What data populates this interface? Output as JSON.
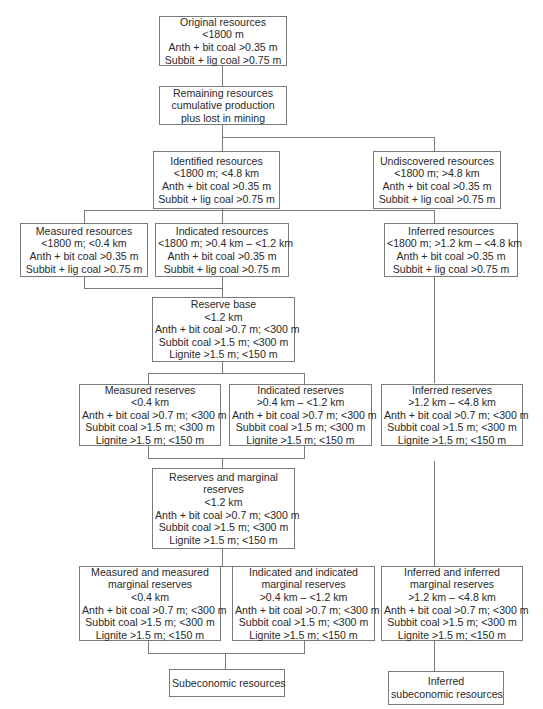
{
  "diagram": {
    "type": "coal resource classification flowchart",
    "nodes": {
      "original": {
        "lines": [
          "Original resources",
          "<1800 m",
          "Anth + bit coal >0.35 m",
          "Subbit + lig coal >0.75 m"
        ]
      },
      "remaining": {
        "lines": [
          "Remaining resources",
          "cumulative production",
          "plus lost in mining"
        ]
      },
      "identified": {
        "lines": [
          "Identified resources",
          "<1800 m; <4.8 km",
          "Anth + bit coal >0.35 m",
          "Subbit + lig coal >0.75 m"
        ]
      },
      "undiscovered": {
        "lines": [
          "Undiscovered resources",
          "<1800 m; >4.8 km",
          "Anth + bit coal >0.35 m",
          "Subbit + lig coal >0.75 m"
        ]
      },
      "measured_resources": {
        "lines": [
          "Measured resources",
          "<1800 m; <0.4 km",
          "Anth + bit coal >0.35 m",
          "Subbit + lig coal >0.75 m"
        ]
      },
      "indicated_resources": {
        "lines": [
          "Indicated resources",
          "<1800 m; >0.4 km – <1.2 km",
          "Anth + bit coal >0.35 m",
          "Subbit + lig coal >0.75 m"
        ]
      },
      "inferred_resources": {
        "lines": [
          "Inferred resources",
          "<1800 m; >1.2 km – <4.8 km",
          "Anth + bit coal >0.35 m",
          "Subbit + lig coal >0.75 m"
        ]
      },
      "reserve_base": {
        "lines": [
          "Reserve base",
          "<1.2 km",
          "Anth + bit coal >0.7 m; <300 m",
          "Subbit coal >1.5 m; <300 m",
          "Lignite >1.5 m; <150 m"
        ]
      },
      "measured_reserves": {
        "lines": [
          "Measured reserves",
          "<0.4 km",
          "Anth + bit coal >0.7 m; <300 m",
          "Subbit coal >1.5 m; <300 m",
          "Lignite >1.5 m; <150 m"
        ]
      },
      "indicated_reserves": {
        "lines": [
          "Indicated reserves",
          ">0.4 km – <1.2 km",
          "Anth + bit coal >0.7 m; <300 m",
          "Subbit coal >1.5 m; <300 m",
          "Lignite >1.5 m; <150 m"
        ]
      },
      "inferred_reserves": {
        "lines": [
          "Inferred reserves",
          ">1.2 km – <4.8 km",
          "Anth + bit coal >0.7 m; <300 m",
          "Subbit coal >1.5 m; <300 m",
          "Lignite >1.5 m; <150 m"
        ]
      },
      "reserves_marginal": {
        "lines": [
          "Reserves and marginal",
          "reserves",
          "<1.2 km",
          "Anth + bit coal >0.7 m; <300 m",
          "Subbit coal >1.5 m; <300 m",
          "Lignite >1.5 m; <150 m"
        ]
      },
      "measured_marginal": {
        "lines": [
          "Measured and measured",
          "marginal reserves",
          "<0.4 km",
          "Anth + bit coal >0.7 m; <300 m",
          "Subbit coal >1.5 m; <300 m",
          "Lignite >1.5 m; <150 m"
        ]
      },
      "indicated_marginal": {
        "lines": [
          "Indicated and indicated",
          "marginal reserves",
          ">0.4 km – <1.2 km",
          "Anth + bit coal >0.7 m; <300 m",
          "Subbit coal >1.5 m; <300 m",
          "Lignite >1.5 m; <150 m"
        ]
      },
      "inferred_marginal": {
        "lines": [
          "Inferred and inferred",
          "marginal reserves",
          ">1.2 km – <4.8 km",
          "Anth + bit coal >0.7 m; <300 m",
          "Subbit coal >1.5 m; <300 m",
          "Lignite >1.5 m; <150 m"
        ]
      },
      "subeconomic": {
        "lines": [
          "Subeconomic resources"
        ]
      },
      "inferred_subeconomic": {
        "lines": [
          "Inferred",
          "subeconomic resources"
        ]
      }
    },
    "edges": [
      [
        "original",
        "remaining"
      ],
      [
        "remaining",
        "identified"
      ],
      [
        "remaining",
        "undiscovered"
      ],
      [
        "identified",
        "measured_resources"
      ],
      [
        "identified",
        "indicated_resources"
      ],
      [
        "identified",
        "inferred_resources"
      ],
      [
        "measured_resources",
        "reserve_base"
      ],
      [
        "indicated_resources",
        "reserve_base"
      ],
      [
        "reserve_base",
        "measured_reserves"
      ],
      [
        "reserve_base",
        "indicated_reserves"
      ],
      [
        "inferred_resources",
        "inferred_reserves"
      ],
      [
        "measured_reserves",
        "reserves_marginal"
      ],
      [
        "indicated_reserves",
        "reserves_marginal"
      ],
      [
        "reserves_marginal",
        "measured_marginal"
      ],
      [
        "reserves_marginal",
        "indicated_marginal"
      ],
      [
        "inferred_reserves",
        "inferred_marginal"
      ],
      [
        "measured_marginal",
        "subeconomic"
      ],
      [
        "indicated_marginal",
        "subeconomic"
      ],
      [
        "inferred_marginal",
        "inferred_subeconomic"
      ]
    ]
  }
}
